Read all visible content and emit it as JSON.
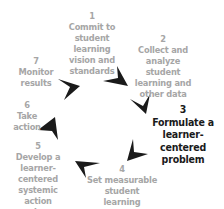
{
  "diagram": {
    "type": "cycle",
    "direction": "clockwise",
    "highlighted_step": 3,
    "colors": {
      "inactive_text": "#a6a6a6",
      "active_text": "#1a1a1a",
      "arrow": "#1a1a1a"
    },
    "steps": [
      {
        "number": "1",
        "label": "Commit to\nstudent learning\nvision and\nstandards"
      },
      {
        "number": "2",
        "label": "Collect and\nanalyze student\nlearning and\nother data"
      },
      {
        "number": "3",
        "label": "Formulate a\nlearner-centered\nproblem"
      },
      {
        "number": "4",
        "label": "Set measurable\nstudent learning\ngoals"
      },
      {
        "number": "5",
        "label": "Develop a\nlearner-centered\nsystemic action\nplan"
      },
      {
        "number": "6",
        "label": "Take action"
      },
      {
        "number": "7",
        "label": "Monitor results"
      }
    ]
  }
}
